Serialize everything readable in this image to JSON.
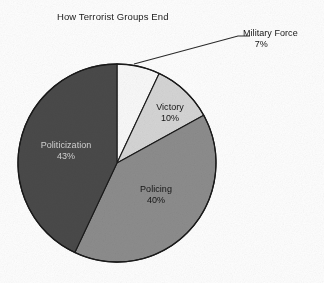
{
  "figure": {
    "title": "How Terrorist Groups End",
    "background_color": "#ffffff"
  },
  "chart_data": {
    "type": "pie",
    "title": "How Terrorist Groups End",
    "xlabel": "",
    "ylabel": "",
    "units": "percent",
    "total": 100,
    "start_angle_deg": 0,
    "direction": "clockwise",
    "legend": "none",
    "grid": false,
    "labels_position": "inside-slices, military-force external with leader line",
    "categories": [
      "Military Force",
      "Victory",
      "Policing",
      "Politicization"
    ],
    "values": [
      7,
      10,
      40,
      43
    ],
    "slices": [
      {
        "name": "Military Force",
        "label": "Military Force",
        "value": 7,
        "pct_text": "7%",
        "color": "#fafafa",
        "label_placement": "outside",
        "text_color": "#141414"
      },
      {
        "name": "Victory",
        "label": "Victory",
        "value": 10,
        "pct_text": "10%",
        "color": "#d6d6d6",
        "label_placement": "inside",
        "text_color": "#151515"
      },
      {
        "name": "Policing",
        "label": "Policing",
        "value": 40,
        "pct_text": "40%",
        "color": "#8d8d8d",
        "label_placement": "inside",
        "text_color": "#151515"
      },
      {
        "name": "Politicization",
        "label": "Politicization",
        "value": 43,
        "pct_text": "43%",
        "color": "#4a4a4a",
        "label_placement": "inside",
        "text_color": "#cfcfcf"
      }
    ],
    "colors": [
      "#fafafa",
      "#d6d6d6",
      "#8d8d8d",
      "#4a4a4a"
    ],
    "outline_color": "#1a1a1a",
    "geometry": {
      "center_x": 117,
      "center_y": 163,
      "radius": 99
    },
    "leader_line": {
      "for": "Military Force",
      "from_x": 134,
      "from_y": 64,
      "to_x": 238,
      "to_y": 36,
      "tick_to_x": 250,
      "tick_to_y": 36,
      "color": "#2a2a2a"
    }
  }
}
